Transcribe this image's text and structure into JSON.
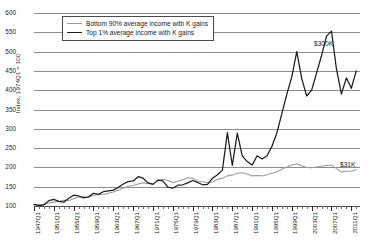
{
  "chart_data": {
    "type": "line",
    "title": "",
    "xlabel": "",
    "ylabel": "Index, 1974Q1 = 100",
    "ylim": [
      100,
      600
    ],
    "yticks": [
      100,
      150,
      200,
      250,
      300,
      350,
      400,
      450,
      500,
      550,
      600
    ],
    "grid": true,
    "legend_position": "top-left-inside",
    "xlim": [
      "1947Q1",
      "2012Q4"
    ],
    "xtick_labels": [
      "1947Q1",
      "1951Q1",
      "1955Q1",
      "1959Q1",
      "1963Q1",
      "1967Q1",
      "1971Q1",
      "1975Q1",
      "1979Q1",
      "1983Q1",
      "1987Q1",
      "1991Q1",
      "1995Q1",
      "1999Q1",
      "2003Q1",
      "2007Q1",
      "2011Q1"
    ],
    "xtick_years": [
      1947,
      1951,
      1955,
      1959,
      1963,
      1967,
      1971,
      1975,
      1979,
      1983,
      1987,
      1991,
      1995,
      1999,
      2003,
      2007,
      2011
    ],
    "minor_tick_interval_years": 1,
    "annotations": [
      {
        "name": "top-series-end-value",
        "text": "$300K",
        "x": 2012.0,
        "y": 520
      },
      {
        "name": "bottom-series-end-value",
        "text": "$31K",
        "x": 2011.0,
        "y": 212
      }
    ],
    "series": [
      {
        "name": "Bottom 90% average income with K gains",
        "color": "#9a9a9a",
        "x": [
          1947,
          1948,
          1949,
          1950,
          1951,
          1952,
          1953,
          1954,
          1955,
          1956,
          1957,
          1958,
          1959,
          1960,
          1961,
          1962,
          1963,
          1964,
          1965,
          1966,
          1967,
          1968,
          1969,
          1970,
          1971,
          1972,
          1973,
          1974,
          1975,
          1976,
          1977,
          1978,
          1979,
          1980,
          1981,
          1982,
          1983,
          1984,
          1985,
          1986,
          1987,
          1988,
          1989,
          1990,
          1991,
          1992,
          1993,
          1994,
          1995,
          1996,
          1997,
          1998,
          1999,
          2000,
          2001,
          2002,
          2003,
          2004,
          2005,
          2006,
          2007,
          2008,
          2009,
          2010,
          2011,
          2012
        ],
        "values": [
          103,
          104,
          103,
          108,
          110,
          112,
          115,
          114,
          119,
          123,
          124,
          122,
          128,
          129,
          130,
          133,
          136,
          141,
          146,
          151,
          153,
          157,
          160,
          158,
          158,
          165,
          170,
          166,
          160,
          164,
          168,
          173,
          172,
          165,
          163,
          160,
          162,
          169,
          172,
          178,
          180,
          185,
          186,
          183,
          178,
          179,
          178,
          181,
          185,
          189,
          195,
          201,
          206,
          209,
          204,
          200,
          199,
          201,
          203,
          205,
          206,
          197,
          188,
          190,
          190,
          194
        ]
      },
      {
        "name": "Top 1% average income with K gains",
        "color": "#1c1c1c",
        "x": [
          1947,
          1948,
          1949,
          1950,
          1951,
          1952,
          1953,
          1954,
          1955,
          1956,
          1957,
          1958,
          1959,
          1960,
          1961,
          1962,
          1963,
          1964,
          1965,
          1966,
          1967,
          1968,
          1969,
          1970,
          1971,
          1972,
          1973,
          1974,
          1975,
          1976,
          1977,
          1978,
          1979,
          1980,
          1981,
          1982,
          1983,
          1984,
          1985,
          1986,
          1987,
          1988,
          1989,
          1990,
          1991,
          1992,
          1993,
          1994,
          1995,
          1996,
          1997,
          1998,
          1999,
          2000,
          2001,
          2002,
          2003,
          2004,
          2005,
          2006,
          2007,
          2008,
          2009,
          2010,
          2011,
          2012
        ],
        "values": [
          104,
          101,
          103,
          114,
          117,
          112,
          110,
          120,
          128,
          126,
          121,
          124,
          133,
          130,
          137,
          139,
          141,
          148,
          157,
          163,
          165,
          176,
          172,
          160,
          156,
          167,
          165,
          149,
          146,
          154,
          155,
          160,
          166,
          161,
          155,
          156,
          172,
          181,
          193,
          290,
          205,
          289,
          230,
          215,
          206,
          230,
          222,
          230,
          255,
          290,
          340,
          390,
          435,
          500,
          430,
          385,
          400,
          445,
          490,
          540,
          553,
          455,
          390,
          432,
          405,
          450
        ]
      }
    ]
  },
  "legend": {
    "items": [
      {
        "label": "Bottom 90% average income with K gains",
        "swatch": "line-gray"
      },
      {
        "label": "Top 1% average income with K gains",
        "swatch": "line-black"
      }
    ]
  },
  "axis": {
    "y_title": "Index, 1974Q1 = 100"
  }
}
